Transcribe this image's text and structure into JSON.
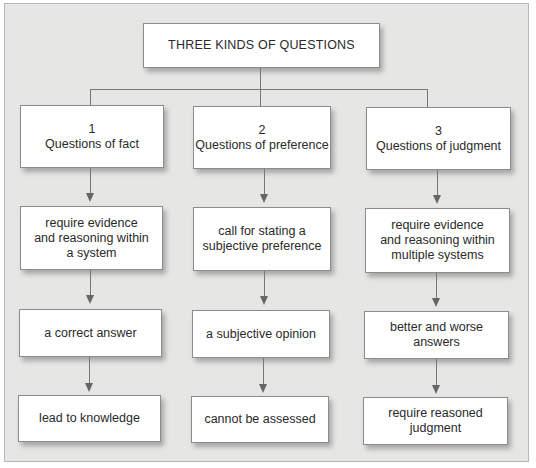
{
  "diagram": {
    "title": "THREE KINDS OF QUESTIONS",
    "columns": [
      {
        "number": "1",
        "heading": "Questions of fact",
        "steps": [
          "require evidence\nand reasoning within\na system",
          "a correct answer",
          "lead to knowledge"
        ]
      },
      {
        "number": "2",
        "heading": "Questions of preference",
        "steps": [
          "call for stating a\nsubjective preference",
          "a subjective opinion",
          "cannot be assessed"
        ]
      },
      {
        "number": "3",
        "heading": "Questions of judgment",
        "steps": [
          "require evidence\nand reasoning within\nmultiple systems",
          "better and worse\nanswers",
          "require reasoned\njudgment"
        ]
      }
    ],
    "colors": {
      "background": "#e6e6e4",
      "box_fill": "#ffffff",
      "connector": "#777777",
      "text": "#2a2a2a"
    }
  }
}
